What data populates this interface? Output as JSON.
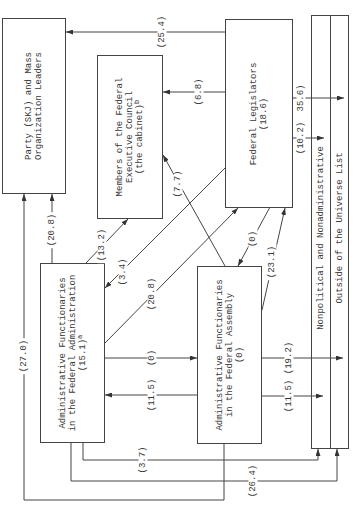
{
  "diagram": {
    "nodes": {
      "party": {
        "lines": [
          "Party (SKJ) and Mass",
          "Organization Leaders"
        ]
      },
      "cabinet": {
        "lines": [
          "Members of the Federal",
          "Executive Council",
          "(the cabinet)"
        ],
        "footnote": "b"
      },
      "legislators": {
        "lines": [
          "Federal Legislators",
          "(18.6)"
        ]
      },
      "admin": {
        "lines": [
          "Administrative Functionaries",
          "in the Federal Administration",
          "(15.1)"
        ],
        "footnote": "a"
      },
      "assembly": {
        "lines": [
          "Administrative Functionaries",
          "in the Federal Assembly",
          "(0)"
        ]
      },
      "nonpolitical": {
        "label": "Nonpolitical and Nonadministrative"
      },
      "outside": {
        "label": "Outside of the Universe List"
      }
    },
    "flows": [
      {
        "from": "legislators",
        "to": "party",
        "label": "(25.4)"
      },
      {
        "from": "legislators",
        "to": "cabinet",
        "label": "(6.8)"
      },
      {
        "from": "legislators",
        "to": "outside",
        "label": "35.6)"
      },
      {
        "from": "legislators",
        "to": "nonpolitical",
        "label": "(10.2)"
      },
      {
        "from": "assembly",
        "to": "cabinet",
        "label": "(7.7)"
      },
      {
        "from": "admin",
        "to": "cabinet",
        "label": "(13.2)"
      },
      {
        "from": "legislators",
        "to": "admin",
        "label": "(3.4)"
      },
      {
        "from": "admin",
        "to": "legislators",
        "label": "(20.8)"
      },
      {
        "from": "admin",
        "to": "assembly",
        "label": "(0)"
      },
      {
        "from": "assembly",
        "to": "admin",
        "label": "(11.5)"
      },
      {
        "from": "legislators",
        "to": "assembly",
        "label": "(0)"
      },
      {
        "from": "assembly",
        "to": "legislators",
        "label": "(23.1)"
      },
      {
        "from": "assembly",
        "to": "outside",
        "label": "(19.2)"
      },
      {
        "from": "assembly",
        "to": "nonpolitical",
        "label": "(11.5)"
      },
      {
        "from": "admin",
        "to": "party",
        "label": "(20.8)"
      },
      {
        "from": "assembly",
        "to": "party",
        "label": "(27.0)"
      },
      {
        "from": "admin",
        "to": "nonpolitical",
        "label": "(3.7)"
      },
      {
        "from": "admin",
        "to": "outside",
        "label": "(26.4)"
      }
    ]
  }
}
